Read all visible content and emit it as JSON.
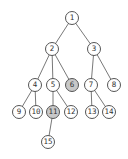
{
  "diagram": {
    "type": "tree",
    "colors": {
      "edge": "#555555",
      "node_fill": "#ffffff",
      "highlight_fill": "#c8c8c8",
      "text": "#333333"
    },
    "nodes": [
      {
        "id": "1",
        "label": "1",
        "x": 72,
        "y": 18,
        "highlighted": false
      },
      {
        "id": "2",
        "label": "2",
        "x": 52,
        "y": 49,
        "highlighted": false
      },
      {
        "id": "3",
        "label": "3",
        "x": 94,
        "y": 49,
        "highlighted": false
      },
      {
        "id": "4",
        "label": "4",
        "x": 35,
        "y": 85,
        "highlighted": false
      },
      {
        "id": "5",
        "label": "5",
        "x": 53,
        "y": 85,
        "highlighted": false
      },
      {
        "id": "6",
        "label": "6",
        "x": 72,
        "y": 85,
        "highlighted": true
      },
      {
        "id": "7",
        "label": "7",
        "x": 91,
        "y": 85,
        "highlighted": false
      },
      {
        "id": "8",
        "label": "8",
        "x": 114,
        "y": 85,
        "highlighted": false
      },
      {
        "id": "9",
        "label": "9",
        "x": 19,
        "y": 112,
        "highlighted": false
      },
      {
        "id": "10",
        "label": "10",
        "x": 36,
        "y": 112,
        "highlighted": false
      },
      {
        "id": "11",
        "label": "11",
        "x": 53,
        "y": 112,
        "highlighted": true
      },
      {
        "id": "12",
        "label": "12",
        "x": 71,
        "y": 112,
        "highlighted": false
      },
      {
        "id": "13",
        "label": "13",
        "x": 92,
        "y": 112,
        "highlighted": false
      },
      {
        "id": "14",
        "label": "14",
        "x": 109,
        "y": 112,
        "highlighted": false
      },
      {
        "id": "15",
        "label": "15",
        "x": 48,
        "y": 142,
        "highlighted": false
      }
    ],
    "edges": [
      [
        "1",
        "2"
      ],
      [
        "1",
        "3"
      ],
      [
        "2",
        "4"
      ],
      [
        "2",
        "5"
      ],
      [
        "2",
        "6"
      ],
      [
        "3",
        "7"
      ],
      [
        "3",
        "8"
      ],
      [
        "4",
        "9"
      ],
      [
        "4",
        "10"
      ],
      [
        "5",
        "11"
      ],
      [
        "5",
        "12"
      ],
      [
        "7",
        "13"
      ],
      [
        "7",
        "14"
      ],
      [
        "11",
        "15"
      ]
    ]
  }
}
